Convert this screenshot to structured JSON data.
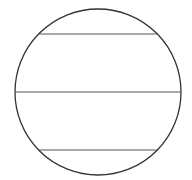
{
  "diagram": {
    "canvas": {
      "width": 192,
      "height": 180,
      "background": "#ffffff"
    },
    "circle": {
      "cx": 98,
      "cy": 92,
      "r": 83,
      "stroke": "#333333",
      "stroke_width": 1.3
    },
    "chords": [
      {
        "y": 34,
        "stroke": "#555555"
      },
      {
        "y": 92,
        "stroke": "#555555"
      },
      {
        "y": 150,
        "stroke": "#555555"
      }
    ]
  }
}
